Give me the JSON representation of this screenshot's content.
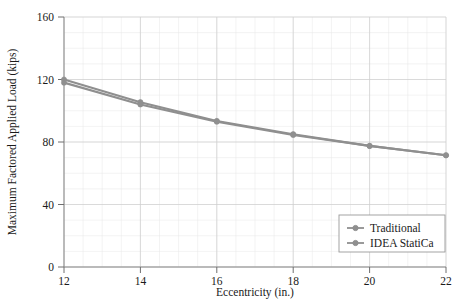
{
  "chart_data": {
    "type": "line",
    "title": "",
    "xlabel": "Eccentricity (in.)",
    "ylabel": "Maximum Factored Applied Load (kips)",
    "x": [
      12,
      14,
      16,
      18,
      20,
      22
    ],
    "xlim": [
      12,
      22
    ],
    "ylim": [
      0,
      160
    ],
    "xticks": [
      "12",
      "14",
      "16",
      "18",
      "20",
      "22"
    ],
    "yticks": [
      "0",
      "40",
      "80",
      "120",
      "160"
    ],
    "grid": true,
    "legend_position": "bottom-right",
    "series": [
      {
        "name": "Traditional",
        "color": "#8f8f8f",
        "marker": "circle",
        "values": [
          120,
          105.5,
          93.5,
          85,
          77.5,
          71.5
        ]
      },
      {
        "name": "IDEA StatiCa",
        "color": "#8f8f8f",
        "marker": "circle",
        "values": [
          118,
          104,
          93,
          84.5,
          77.5,
          71.5
        ]
      }
    ]
  },
  "legend": {
    "entries": [
      {
        "label": "Traditional"
      },
      {
        "label": "IDEA StatiCa"
      }
    ]
  },
  "axes": {
    "x_title": "Eccentricity (in.)",
    "y_title": "Maximum Factored Applied Load (kips)",
    "x_tick_labels": [
      "12",
      "14",
      "16",
      "18",
      "20",
      "22"
    ],
    "y_tick_labels": [
      "0",
      "40",
      "80",
      "120",
      "160"
    ]
  },
  "colors": {
    "series": "#8f8f8f",
    "grid_major": "#cfcfcf",
    "grid_minor": "#e6e6e6",
    "axis": "#8a8a8a",
    "text": "#1a1a1a",
    "background": "#ffffff"
  }
}
